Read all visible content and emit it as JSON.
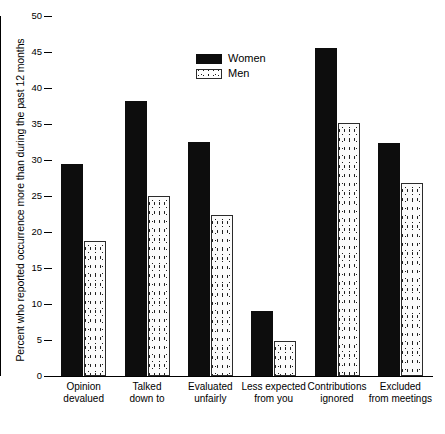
{
  "chart_data": {
    "type": "bar",
    "title": "",
    "xlabel": "",
    "ylabel": "Percent who reported occurrence more than during the past 12 months",
    "ylim": [
      0,
      50
    ],
    "yticks": [
      0,
      5,
      10,
      15,
      20,
      25,
      30,
      35,
      40,
      45,
      50
    ],
    "grid": false,
    "legend_position": "top-center",
    "categories": [
      "Opinion devalued",
      "Talked down to",
      "Evaluated unfairly",
      "Less expected from you",
      "Contributions ignored",
      "Excluded from meetings"
    ],
    "category_lines": [
      [
        "Opinion",
        "devalued"
      ],
      [
        "Talked",
        "down to"
      ],
      [
        "Evaluated",
        "unfairly"
      ],
      [
        "Less expected",
        "from you"
      ],
      [
        "Contributions",
        "ignored"
      ],
      [
        "Excluded",
        "from meetings"
      ]
    ],
    "series": [
      {
        "name": "Women",
        "color": "#0d0d0d",
        "fill": "solid",
        "values": [
          29.5,
          38.2,
          32.5,
          9.0,
          45.6,
          32.3
        ]
      },
      {
        "name": "Men",
        "color": "#ffffff",
        "fill": "speckled",
        "values": [
          18.8,
          25.0,
          22.4,
          4.8,
          35.2,
          26.8
        ]
      }
    ]
  },
  "axis": {
    "y_title": "Percent who reported occurrence more than during the past 12 months",
    "tick_labels": [
      "0",
      "5",
      "10",
      "15",
      "20",
      "25",
      "30",
      "35",
      "40",
      "45",
      "50"
    ]
  },
  "legend": {
    "entries": [
      {
        "label": "Women"
      },
      {
        "label": "Men"
      }
    ]
  }
}
